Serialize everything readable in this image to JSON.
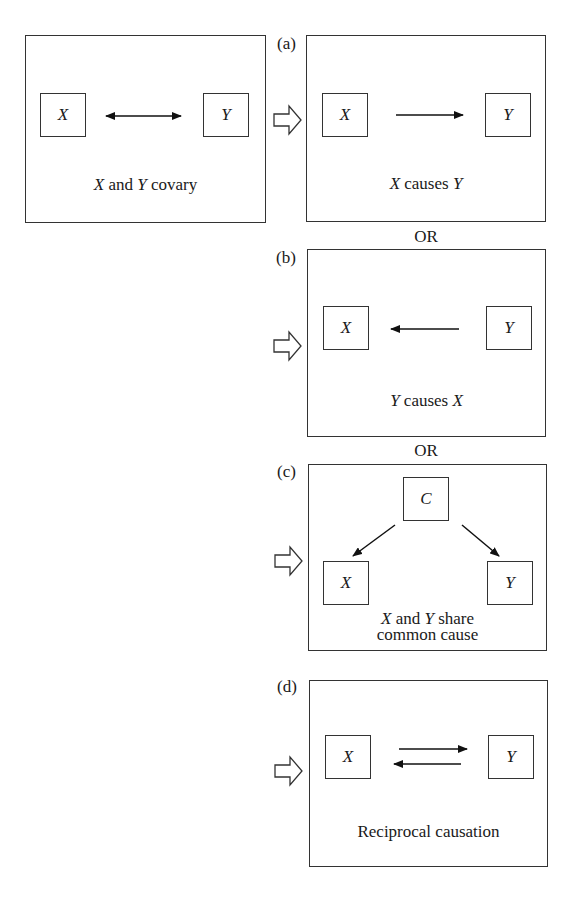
{
  "figure": {
    "premise": {
      "node_x": "X",
      "node_y": "Y",
      "caption_var1": "X",
      "caption_mid": " and ",
      "caption_var2": "Y",
      "caption_end": " covary"
    },
    "connector": "OR",
    "panels": [
      {
        "label": "(a)",
        "node_x": "X",
        "node_y": "Y",
        "caption_var1": "X",
        "caption_mid": " causes ",
        "caption_var2": "Y"
      },
      {
        "label": "(b)",
        "node_x": "X",
        "node_y": "Y",
        "caption_var1": "Y",
        "caption_mid": " causes ",
        "caption_var2": "X"
      },
      {
        "label": "(c)",
        "node_c": "C",
        "node_x": "X",
        "node_y": "Y",
        "caption_var1": "X",
        "caption_mid": " and ",
        "caption_var2": "Y",
        "caption_end": " share",
        "caption_line2": "common cause"
      },
      {
        "label": "(d)",
        "node_x": "X",
        "node_y": "Y",
        "caption": "Reciprocal causation"
      }
    ]
  }
}
